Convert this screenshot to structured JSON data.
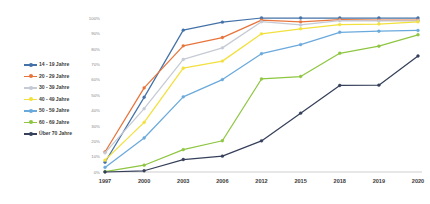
{
  "chart_data": {
    "type": "line",
    "title": "",
    "subtitle": "",
    "xlabel": "",
    "ylabel": "",
    "x": [
      "1997",
      "2000",
      "2003",
      "2006",
      "2012",
      "2015",
      "2018",
      "2019",
      "2020"
    ],
    "categories": [
      "1997",
      "2000",
      "2003",
      "2006",
      "2012",
      "2015",
      "2018",
      "2019",
      "2020"
    ],
    "ylim": [
      0,
      100
    ],
    "yticks": [
      0,
      10,
      20,
      30,
      40,
      50,
      60,
      70,
      80,
      90,
      100
    ],
    "ytick_labels": [
      "0%",
      "10%",
      "20%",
      "30%",
      "40%",
      "50%",
      "60%",
      "70%",
      "80%",
      "90%",
      "100%"
    ],
    "grid": false,
    "legend_position": "left",
    "value_suffix": "%",
    "series": [
      {
        "name": "14 - 19 Jahre",
        "color": "#4472a8",
        "values": [
          6.3,
          48.5,
          92.1,
          97.3,
          100.0,
          100.0,
          100.0,
          100.0,
          100.0
        ]
      },
      {
        "name": "20 - 29 Jahre",
        "color": "#e8743b",
        "values": [
          13.0,
          54.6,
          81.9,
          87.3,
          98.6,
          97.5,
          98.9,
          98.6,
          98.6
        ]
      },
      {
        "name": "30 - 39 Jahre",
        "color": "#c5cad4",
        "values": [
          12.4,
          41.1,
          73.1,
          80.6,
          97.6,
          95.5,
          98.3,
          98.1,
          98.2
        ]
      },
      {
        "name": "40 - 49 Jahre",
        "color": "#f2e03c",
        "values": [
          7.7,
          32.2,
          67.4,
          72.0,
          89.7,
          93.0,
          95.7,
          96.1,
          97.5
        ]
      },
      {
        "name": "50 - 59 Jahre",
        "color": "#6aa9dc",
        "values": [
          3.0,
          22.1,
          48.8,
          60.0,
          76.8,
          82.7,
          90.7,
          91.4,
          91.9
        ]
      },
      {
        "name": "60 - 69 Jahre",
        "color": "#8ec641",
        "values": [
          0.2,
          4.4,
          14.5,
          20.3,
          60.4,
          62.0,
          77.1,
          81.7,
          89.1
        ]
      },
      {
        "name": "Über 70 Jahre",
        "color": "#36405a",
        "values": [
          0.0,
          0.8,
          8.1,
          10.3,
          20.2,
          38.2,
          56.2,
          56.4,
          75.3
        ]
      }
    ]
  }
}
